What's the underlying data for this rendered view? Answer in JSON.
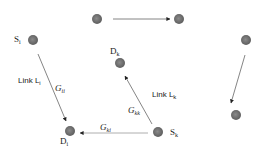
{
  "diagram": {
    "type": "wireless interference network",
    "nodes": [
      {
        "id": "n1",
        "x": 97,
        "y": 19,
        "label": ""
      },
      {
        "id": "n2",
        "x": 179,
        "y": 19,
        "label": ""
      },
      {
        "id": "Si",
        "x": 33,
        "y": 40,
        "label": "S",
        "sub": "i"
      },
      {
        "id": "Di",
        "x": 70,
        "y": 131,
        "label": "D",
        "sub": "i"
      },
      {
        "id": "Dk",
        "x": 120,
        "y": 63,
        "label": "D",
        "sub": "k"
      },
      {
        "id": "Sk",
        "x": 158,
        "y": 132,
        "label": "S",
        "sub": "k"
      },
      {
        "id": "n3",
        "x": 246,
        "y": 40,
        "label": ""
      },
      {
        "id": "n4",
        "x": 236,
        "y": 115,
        "label": ""
      }
    ],
    "edges": [
      {
        "from": "n1",
        "to": "n2",
        "label": ""
      },
      {
        "from": "Si",
        "to": "Di",
        "label": "G",
        "sub": "ii"
      },
      {
        "from": "Sk",
        "to": "Dk",
        "label": "G",
        "sub": "kk"
      },
      {
        "from": "Sk",
        "to": "Di",
        "label": "G",
        "sub": "ki"
      },
      {
        "from": "n3",
        "to": "n4",
        "label": ""
      }
    ],
    "labels": {
      "si": {
        "main": "S",
        "sub": "i"
      },
      "di": {
        "main": "D",
        "sub": "i"
      },
      "dk": {
        "main": "D",
        "sub": "k"
      },
      "sk": {
        "main": "S",
        "sub": "k"
      },
      "link_i": {
        "main": "Link L",
        "sub": "i"
      },
      "link_k": {
        "main": "Link L",
        "sub": "k"
      },
      "g_ii": {
        "main": "G",
        "sub": "ii"
      },
      "g_kk": {
        "main": "G",
        "sub": "kk"
      },
      "g_ki": {
        "main": "G",
        "sub": "ki"
      }
    },
    "colors": {
      "node": "#6e6e6e",
      "edge": "#555555",
      "text": "#222222"
    }
  }
}
